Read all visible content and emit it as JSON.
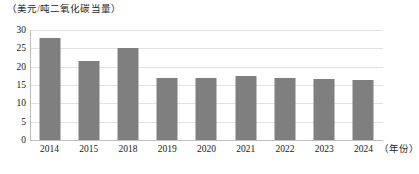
{
  "chart_data": {
    "type": "bar",
    "title": "（美元/吨二氧化碳当量）",
    "xlabel": "（年份）",
    "ylabel": "",
    "categories": [
      "2014",
      "2015",
      "2018",
      "2019",
      "2020",
      "2021",
      "2022",
      "2023",
      "2024"
    ],
    "values": [
      27.7,
      21.5,
      25.0,
      16.8,
      16.8,
      17.5,
      17.0,
      16.7,
      16.4
    ],
    "series": [
      {
        "name": "",
        "values": [
          27.7,
          21.5,
          25.0,
          16.8,
          16.8,
          17.5,
          17.0,
          16.7,
          16.4
        ]
      }
    ],
    "ylim": [
      0,
      30
    ],
    "yticks": [
      "0",
      "5",
      "10",
      "15",
      "20",
      "25",
      "30"
    ],
    "ytick_values": [
      0,
      5,
      10,
      15,
      20,
      25,
      30
    ],
    "grid": true,
    "legend": false,
    "bar_color": "#7f7f7f",
    "gridline_color": "#e2e2e2",
    "axis_color": "#bdbdbd"
  }
}
